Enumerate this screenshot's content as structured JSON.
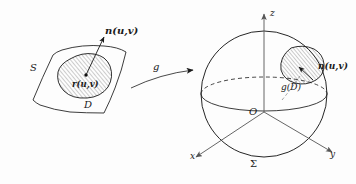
{
  "figure": {
    "background_color": "#fdfdfd",
    "ink_color": "#1a1a1a"
  },
  "left_patch": {
    "surface_label": "S",
    "region_label": "D",
    "point_label": "r(u,v)",
    "normal_label": "n(u,v)"
  },
  "map": {
    "arrow_label": "g"
  },
  "sphere": {
    "surface_label": "Σ",
    "origin_label": "O",
    "image_region_label": "g(D)",
    "normal_label": "n(u,v)",
    "axis_z": "z",
    "axis_x": "x",
    "axis_y": "y"
  }
}
